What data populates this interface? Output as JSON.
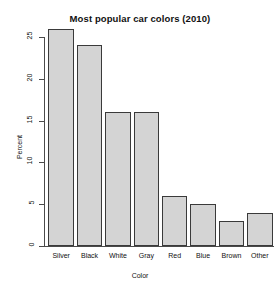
{
  "chart_data": {
    "type": "bar",
    "title": "Most popular car colors (2010)",
    "xlabel": "Color",
    "ylabel": "Percent",
    "categories": [
      "Silver",
      "Black",
      "White",
      "Gray",
      "Red",
      "Blue",
      "Brown",
      "Other"
    ],
    "values": [
      26,
      24,
      16,
      16,
      6,
      5,
      3,
      4
    ],
    "yticks": [
      0,
      5,
      10,
      15,
      20,
      25
    ],
    "ytick_labels": [
      "0",
      "5",
      "10",
      "15",
      "20",
      "25"
    ],
    "ylim": [
      0,
      26
    ],
    "grid": false,
    "legend": false,
    "bar_fill_color": "#d4d4d4",
    "bar_border_color": "#3a3a3a",
    "axis_color": "#4a4a4a",
    "background_color": "#ffffff"
  }
}
